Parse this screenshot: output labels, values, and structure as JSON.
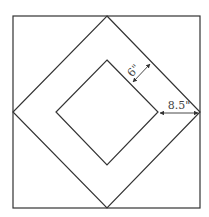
{
  "diagram": {
    "labels": {
      "band_width": "6\"",
      "gap_width": "8.5\""
    },
    "colors": {
      "stroke": "#333333",
      "background": "#ffffff"
    }
  }
}
